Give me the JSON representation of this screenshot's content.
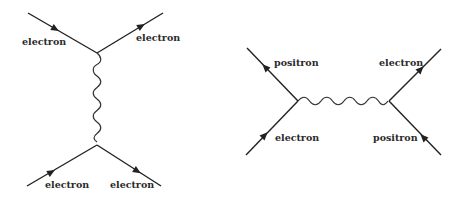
{
  "diagrams": [
    {
      "id": "scattering",
      "labels": {
        "top_left": "electron",
        "top_right": "electron",
        "bottom_left": "electron",
        "bottom_right": "electron"
      }
    },
    {
      "id": "annihilation",
      "labels": {
        "top_left": "positron",
        "bottom_left": "electron",
        "top_right": "electron",
        "bottom_right": "positron"
      }
    }
  ],
  "colors": {
    "line": "#222222",
    "background": "#ffffff"
  }
}
